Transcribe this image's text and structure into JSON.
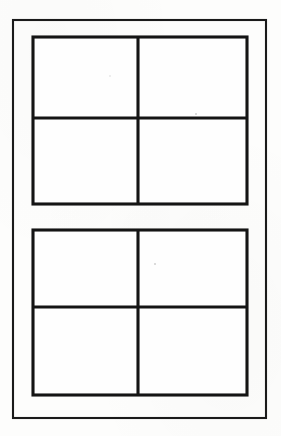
{
  "figure": {
    "background_color": "#fdfdfc",
    "line_color": "#141414",
    "pane_color": "#fefefe",
    "canvas": {
      "width": 281,
      "height": 436
    }
  },
  "outer_frame": {
    "name": "window outer frame",
    "x": 13,
    "y": 20,
    "width": 253,
    "height": 398,
    "stroke_width": 2.1
  },
  "sashes": [
    {
      "name": "upper sash",
      "position": "top",
      "x": 33,
      "y": 37,
      "width": 214,
      "height": 167,
      "stroke_width": 3.1,
      "mullion_x": 138,
      "muntin_y": 118,
      "panes": [
        {
          "name": "upper-left pane",
          "x": 33,
          "y": 37,
          "width": 105,
          "height": 81
        },
        {
          "name": "upper-right pane",
          "x": 138,
          "y": 37,
          "width": 109,
          "height": 81
        },
        {
          "name": "lower-left pane",
          "x": 33,
          "y": 118,
          "width": 105,
          "height": 86
        },
        {
          "name": "lower-right pane",
          "x": 138,
          "y": 118,
          "width": 109,
          "height": 86
        }
      ]
    },
    {
      "name": "lower sash",
      "position": "bottom",
      "x": 33,
      "y": 230,
      "width": 214,
      "height": 165,
      "stroke_width": 3.1,
      "mullion_x": 138,
      "muntin_y": 307,
      "panes": [
        {
          "name": "upper-left pane",
          "x": 33,
          "y": 230,
          "width": 105,
          "height": 77
        },
        {
          "name": "upper-right pane",
          "x": 138,
          "y": 230,
          "width": 109,
          "height": 77
        },
        {
          "name": "lower-left pane",
          "x": 33,
          "y": 307,
          "width": 105,
          "height": 88
        },
        {
          "name": "lower-right pane",
          "x": 138,
          "y": 307,
          "width": 109,
          "height": 88
        }
      ]
    }
  ],
  "meeting_rail_gap": {
    "top": 204,
    "bottom": 230
  },
  "specks": [
    {
      "cx": 196,
      "cy": 114,
      "r": 1.0
    },
    {
      "cx": 155,
      "cy": 264,
      "r": 1.0
    },
    {
      "cx": 110,
      "cy": 76,
      "r": 0.7
    }
  ]
}
